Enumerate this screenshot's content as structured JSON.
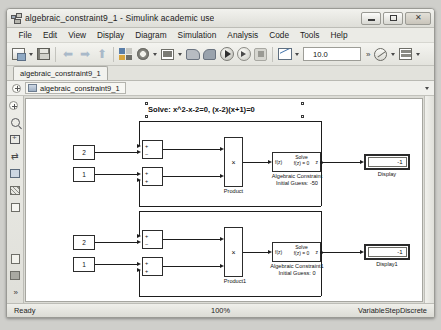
{
  "window": {
    "title": "algebraic_constraint9_1 - Simulink academic use",
    "icon": "simulink-icon",
    "minimize_label": "minimize",
    "maximize_label": "maximize",
    "close_label": "close"
  },
  "menu": {
    "items": [
      {
        "label": "File"
      },
      {
        "label": "Edit"
      },
      {
        "label": "View"
      },
      {
        "label": "Display"
      },
      {
        "label": "Diagram"
      },
      {
        "label": "Simulation"
      },
      {
        "label": "Analysis"
      },
      {
        "label": "Code"
      },
      {
        "label": "Tools"
      },
      {
        "label": "Help"
      }
    ]
  },
  "toolbar": {
    "new_model": "new-model-icon",
    "save": "save-icon",
    "back": "back-arrow-icon",
    "forward": "forward-arrow-icon",
    "up": "up-arrow-icon",
    "library_browser": "library-browser-icon",
    "model_settings": "gear-icon",
    "model_explorer": "model-explorer-icon",
    "build": "build-model-icon",
    "fast_restart": "fast-restart-icon",
    "run": "run-icon",
    "step_forward": "step-forward-icon",
    "stop": "stop-icon",
    "scope": "scope-icon",
    "stop_time_value": "10.0",
    "overflow": "»",
    "performance": "performance-icon",
    "schedule": "schedule-icon"
  },
  "tabs": [
    {
      "label": "algebraic_constraint9_1"
    }
  ],
  "breadcrumb": {
    "expand": "expand-icon",
    "icon": "model-icon",
    "path": "algebraic_constraint9_1",
    "caret": "chevron-down-icon"
  },
  "palette": {
    "items": [
      {
        "name": "expand-panel-icon"
      },
      {
        "name": "zoom-icon"
      },
      {
        "name": "fit-to-view-icon"
      },
      {
        "name": "resize-icon"
      },
      {
        "name": "image-icon"
      },
      {
        "name": "hatch-icon"
      },
      {
        "name": "rectangle-icon"
      },
      {
        "name": "doc-icon"
      },
      {
        "name": "layers-icon"
      },
      {
        "name": "more-icon"
      }
    ]
  },
  "canvas": {
    "annotation": {
      "text": "Solve: x^2-x-2=0, (x-2)(x+1)=0",
      "selected": true
    },
    "models": [
      {
        "id": "model-upper",
        "constants": [
          {
            "name": "constant-2",
            "value": "2"
          },
          {
            "name": "constant-1",
            "value": "1"
          }
        ],
        "sums": [
          {
            "name": "sum-upper-a",
            "signs": [
              "+",
              "−"
            ]
          },
          {
            "name": "sum-upper-b",
            "signs": [
              "+",
              "+"
            ]
          }
        ],
        "product": {
          "symbol": "×",
          "label": "Product"
        },
        "algebraic_constraint": {
          "port_in": "f(z)",
          "line1": "Solve",
          "line2": "f(z) = 0",
          "port_out": "z",
          "label": "Algebraic Constraint",
          "initial_guess": "Initial Guess: -50"
        },
        "display": {
          "value": "-1",
          "label": "Display"
        }
      },
      {
        "id": "model-lower",
        "constants": [
          {
            "name": "constant-2",
            "value": "2"
          },
          {
            "name": "constant-1",
            "value": "1"
          }
        ],
        "sums": [
          {
            "name": "sum-lower-a",
            "signs": [
              "+",
              "−"
            ]
          },
          {
            "name": "sum-lower-b",
            "signs": [
              "+",
              "+"
            ]
          }
        ],
        "product": {
          "symbol": "×",
          "label": "Product1"
        },
        "algebraic_constraint": {
          "port_in": "f(z)",
          "line1": "Solve",
          "line2": "f(z) = 0",
          "port_out": "z",
          "label": "Algebraic Constraint1",
          "initial_guess": "Initial Guess: 0"
        },
        "display": {
          "value": "-1",
          "label": "Display1"
        }
      }
    ]
  },
  "statusbar": {
    "state": "Ready",
    "zoom": "100%",
    "solver": "VariableStepDiscrete"
  }
}
